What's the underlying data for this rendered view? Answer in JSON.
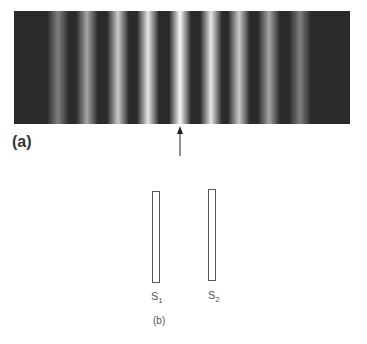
{
  "figure": {
    "panel_a_label": "(a)",
    "panel_b_label": "(b)",
    "fringe_pattern": {
      "description": "double-slit interference fringes",
      "bright_fringe_x": [
        58,
        87,
        118,
        148,
        180,
        211,
        239,
        269,
        300
      ],
      "bright_fringe_intensity": [
        0.35,
        0.55,
        0.75,
        0.9,
        1.0,
        0.9,
        0.75,
        0.55,
        0.35
      ],
      "central_marker": "arrow-up"
    },
    "slits": [
      {
        "name": "S",
        "sub": "1"
      },
      {
        "name": "S",
        "sub": "2"
      }
    ]
  }
}
